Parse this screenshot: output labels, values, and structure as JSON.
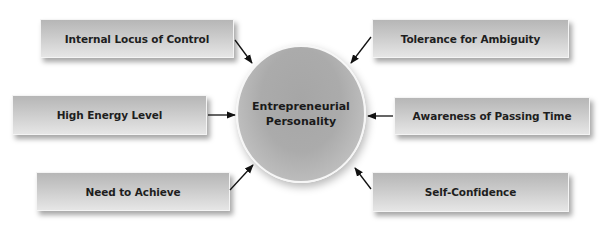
{
  "diagram": {
    "type": "hub-and-spoke",
    "center": {
      "line1": "Entrepreneurial",
      "line2": "Personality"
    },
    "factors": [
      {
        "id": "internal-locus",
        "label": "Internal Locus of Control",
        "position": "top-left"
      },
      {
        "id": "high-energy",
        "label": "High Energy Level",
        "position": "middle-left"
      },
      {
        "id": "need-achieve",
        "label": "Need to Achieve",
        "position": "bottom-left"
      },
      {
        "id": "tolerance-ambiguity",
        "label": "Tolerance for Ambiguity",
        "position": "top-right"
      },
      {
        "id": "awareness-time",
        "label": "Awareness of Passing Time",
        "position": "middle-right"
      },
      {
        "id": "self-confidence",
        "label": "Self-Confidence",
        "position": "bottom-right"
      }
    ],
    "arrow_direction": "factor-to-center",
    "colors": {
      "box_top": "#b6b6b6",
      "box_bottom": "#e6e6e6",
      "hub": "#a8a8a8",
      "text": "#1e1e1e",
      "arrow": "#111111"
    }
  }
}
